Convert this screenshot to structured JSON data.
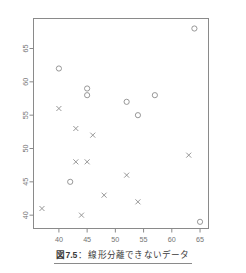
{
  "chart_data": {
    "type": "scatter",
    "title": "",
    "xlabel": "",
    "ylabel": "",
    "xlim": [
      35.5,
      66.5
    ],
    "ylim": [
      38.0,
      69.5
    ],
    "xticks": [
      40,
      45,
      50,
      55,
      60,
      65
    ],
    "yticks": [
      40,
      45,
      50,
      55,
      60,
      65
    ],
    "xtick_labels": [
      "40",
      "45",
      "50",
      "55",
      "60",
      "65"
    ],
    "ytick_labels": [
      "40",
      "45",
      "50",
      "55",
      "60",
      "65"
    ],
    "grid": false,
    "legend": false,
    "legend_position": "none",
    "frame": true,
    "series": [
      {
        "name": "class-circle",
        "marker": "circle",
        "color": "#8c8c8c",
        "points": [
          {
            "x": 40,
            "y": 62
          },
          {
            "x": 45,
            "y": 59
          },
          {
            "x": 45,
            "y": 58
          },
          {
            "x": 52,
            "y": 57
          },
          {
            "x": 57,
            "y": 58
          },
          {
            "x": 54,
            "y": 55
          },
          {
            "x": 42,
            "y": 45
          },
          {
            "x": 64,
            "y": 68
          },
          {
            "x": 65,
            "y": 39
          }
        ]
      },
      {
        "name": "class-cross",
        "marker": "x",
        "color": "#8c8c8c",
        "points": [
          {
            "x": 40,
            "y": 56
          },
          {
            "x": 43,
            "y": 53
          },
          {
            "x": 46,
            "y": 52
          },
          {
            "x": 63,
            "y": 49
          },
          {
            "x": 43,
            "y": 48
          },
          {
            "x": 45,
            "y": 48
          },
          {
            "x": 52,
            "y": 46
          },
          {
            "x": 48,
            "y": 43
          },
          {
            "x": 54,
            "y": 42
          },
          {
            "x": 37,
            "y": 41
          },
          {
            "x": 44,
            "y": 40
          }
        ]
      }
    ]
  },
  "caption": {
    "number": "図7.5",
    "separator": "：",
    "text": "線形分離できないデータ"
  },
  "colors": {
    "axis": "#8a8a8a",
    "frame": "#8a8a8a",
    "marker": "#8c8c8c",
    "tick_text": "#737373",
    "caption_text": "#3b3b3b",
    "background": "#ffffff"
  }
}
